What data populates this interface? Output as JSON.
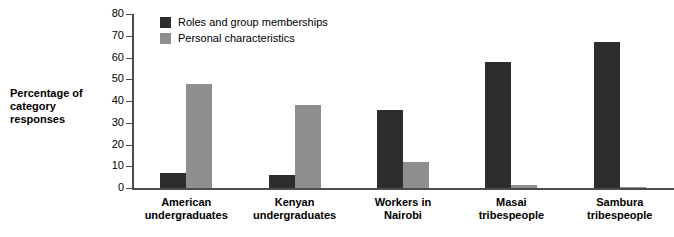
{
  "chart_data": {
    "type": "bar",
    "title": "",
    "xlabel": "",
    "ylabel": "Percentage of\ncategory responses",
    "ylabel_line1": "Percentage of",
    "ylabel_line2": "category responses",
    "ylim": [
      0,
      80
    ],
    "yticks": [
      0,
      10,
      20,
      30,
      40,
      50,
      60,
      70,
      80
    ],
    "ytick_labels": [
      "0",
      "10",
      "20",
      "30",
      "40",
      "50",
      "60",
      "70",
      "80"
    ],
    "grid": false,
    "legend_position": "top-left-inside",
    "categories": [
      "American\nundergraduates",
      "Kenyan\nundergraduates",
      "Workers in\nNairobi",
      "Masai\ntribespeople",
      "Sambura\ntribespeople"
    ],
    "series": [
      {
        "name": "Roles and group memberships",
        "color": "#2d2d2d",
        "values": [
          7,
          6,
          36,
          58,
          67
        ]
      },
      {
        "name": "Personal characteristics",
        "color": "#8e8e8e",
        "values": [
          48,
          38,
          12,
          1.5,
          0.5
        ]
      }
    ],
    "axis_color": "#4c4c4c",
    "background": "#ffffff"
  }
}
